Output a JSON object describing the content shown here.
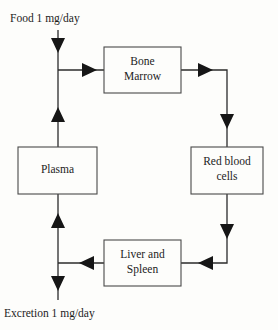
{
  "diagram": {
    "background_color": "#fdfdfb",
    "line_color": "#2b2b2b",
    "box_border_color": "#4a4a4a",
    "text_color": "#1c1c1c",
    "labels": {
      "input": "Food 1 mg/day",
      "output": "Excretion 1 mg/day"
    },
    "boxes": [
      {
        "id": "bone-marrow",
        "line1": "Bone",
        "line2": "Marrow",
        "x": 104,
        "y": 47,
        "width": 77,
        "height": 46
      },
      {
        "id": "red-blood-cells",
        "line1": "Red blood",
        "line2": "cells",
        "x": 191,
        "y": 147,
        "width": 72,
        "height": 47
      },
      {
        "id": "plasma",
        "line1": "Plasma",
        "line2": "",
        "x": 18,
        "y": 147,
        "width": 79,
        "height": 47
      },
      {
        "id": "liver-and-spleen",
        "line1": "Liver and",
        "line2": "Spleen",
        "x": 104,
        "y": 240,
        "width": 77,
        "height": 46
      }
    ],
    "connections": [
      {
        "id": "food-to-plasma",
        "from": "Food 1 mg/day",
        "to": "Plasma"
      },
      {
        "id": "plasma-to-bone-marrow",
        "from": "Plasma",
        "to": "Bone Marrow"
      },
      {
        "id": "bone-marrow-to-red-blood-cells",
        "from": "Bone Marrow",
        "to": "Red blood cells"
      },
      {
        "id": "red-blood-cells-to-liver-and-spleen",
        "from": "Red blood cells",
        "to": "Liver and Spleen"
      },
      {
        "id": "liver-and-spleen-to-plasma",
        "from": "Liver and Spleen",
        "to": "Plasma"
      },
      {
        "id": "plasma-to-excretion",
        "from": "Plasma",
        "to": "Excretion 1 mg/day"
      }
    ]
  }
}
